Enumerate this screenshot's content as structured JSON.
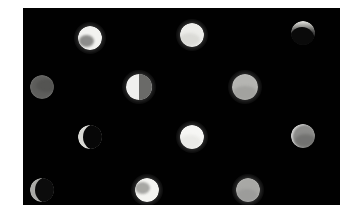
{
  "figure": {
    "width": 347,
    "height": 222,
    "background_color": "#ffffff",
    "plate": {
      "x": 23,
      "y": 8,
      "width": 317,
      "height": 197,
      "background_color": "#010101",
      "label": "dark observation plate"
    },
    "object_count": 12,
    "grid": {
      "rows": 4,
      "columns": 3
    }
  },
  "objects": [
    {
      "id": "obj-r1c1",
      "name": "bright-disc-upper-left",
      "row": 1,
      "column": 1,
      "cx": 90,
      "cy": 38,
      "radius": 12,
      "phase": "gibbous-bright",
      "body_color": "#f2f2f0",
      "shade_color": "#7b7b79",
      "shade_angle_deg": 215,
      "brightness": "very bright",
      "glow": true
    },
    {
      "id": "obj-r1c2",
      "name": "bright-disc-upper-center",
      "row": 1,
      "column": 2,
      "cx": 192,
      "cy": 35,
      "radius": 12,
      "phase": "full",
      "body_color": "#ededea",
      "shade_color": "#c9c9c4",
      "shade_angle_deg": 240,
      "brightness": "very bright",
      "glow": true
    },
    {
      "id": "obj-r1c3",
      "name": "crescent-disc-upper-right",
      "row": 1,
      "column": 3,
      "cx": 303,
      "cy": 33,
      "radius": 12,
      "phase": "thin-crescent-top",
      "body_color": "#2a2a2a",
      "shade_color": "#0a0a0a",
      "shade_angle_deg": 130,
      "brightness": "dark with bright limb",
      "glow": false
    },
    {
      "id": "obj-r2c1",
      "name": "grey-disc-middle-left",
      "row": 2,
      "column": 1,
      "cx": 42,
      "cy": 87,
      "radius": 12,
      "phase": "full-dim",
      "body_color": "#5e5e5c",
      "shade_color": "#4a4a48",
      "shade_angle_deg": 20,
      "brightness": "dim grey",
      "glow": false
    },
    {
      "id": "obj-r2c2",
      "name": "half-disc-middle-center",
      "row": 2,
      "column": 2,
      "cx": 139,
      "cy": 87,
      "radius": 13,
      "phase": "half-left-lit",
      "body_color": "#f0f0ee",
      "shade_color": "#6a6a68",
      "shade_angle_deg": 0,
      "brightness": "half bright half grey",
      "glow": true
    },
    {
      "id": "obj-r2c3",
      "name": "grey-disc-middle-right",
      "row": 2,
      "column": 3,
      "cx": 245,
      "cy": 87,
      "radius": 13,
      "phase": "full-medium",
      "body_color": "#b5b5b2",
      "shade_color": "#8f8f8c",
      "shade_angle_deg": 270,
      "brightness": "medium light grey",
      "glow": true
    },
    {
      "id": "obj-r3c1",
      "name": "crescent-ring-lower-left",
      "row": 3,
      "column": 1,
      "cx": 90,
      "cy": 137,
      "radius": 12,
      "phase": "crescent-left-lit",
      "body_color": "#d8d8d4",
      "shade_color": "#070707",
      "shade_angle_deg": 0,
      "brightness": "dark with thin bright arc",
      "glow": false
    },
    {
      "id": "obj-r3c2",
      "name": "bright-disc-lower-center",
      "row": 3,
      "column": 2,
      "cx": 192,
      "cy": 137,
      "radius": 12,
      "phase": "full",
      "body_color": "#f6f6f4",
      "shade_color": "#dedeDA",
      "shade_angle_deg": 250,
      "brightness": "very bright",
      "glow": true
    },
    {
      "id": "obj-r3c3",
      "name": "grey-disc-lower-right",
      "row": 3,
      "column": 3,
      "cx": 303,
      "cy": 136,
      "radius": 12,
      "phase": "full-medium-rimmed",
      "body_color": "#8c8c8a",
      "shade_color": "#6a6a68",
      "shade_angle_deg": 300,
      "brightness": "medium grey with bright rim",
      "glow": false
    },
    {
      "id": "obj-r4c1",
      "name": "crescent-disc-bottom-left",
      "row": 4,
      "column": 1,
      "cx": 42,
      "cy": 190,
      "radius": 12,
      "phase": "crescent-left-lit",
      "body_color": "#a9a9a6",
      "shade_color": "#0c0c0c",
      "shade_angle_deg": 0,
      "brightness": "dark with bright crescent",
      "glow": false
    },
    {
      "id": "obj-r4c2",
      "name": "bright-disc-bottom-center",
      "row": 4,
      "column": 2,
      "cx": 147,
      "cy": 190,
      "radius": 12,
      "phase": "gibbous-bright",
      "body_color": "#f4f4f1",
      "shade_color": "#9a9a97",
      "shade_angle_deg": 160,
      "brightness": "very bright",
      "glow": true
    },
    {
      "id": "obj-r4c3",
      "name": "grey-disc-bottom-right",
      "row": 4,
      "column": 3,
      "cx": 248,
      "cy": 190,
      "radius": 12,
      "phase": "full-medium",
      "body_color": "#a8a8a5",
      "shade_color": "#909090",
      "shade_angle_deg": 260,
      "brightness": "medium grey",
      "glow": true
    }
  ]
}
